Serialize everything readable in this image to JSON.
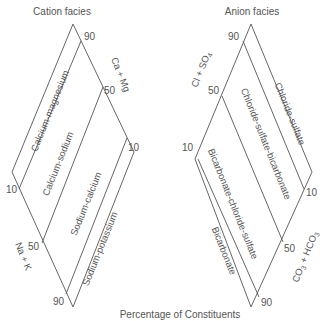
{
  "cation": {
    "title": "Cation facies",
    "axis_top": "Ca + Mg",
    "axis_bottom": "Na + K",
    "ticks": {
      "t90": "90",
      "t50_upper": "50",
      "t10_right": "10",
      "t10_left": "10",
      "t50_lower": "50",
      "t90_bottom": "90"
    },
    "facies": [
      "Calcium-magnesium",
      "Calcium-sodium",
      "Sodium-calcium",
      "Sodium-potassium"
    ]
  },
  "anion": {
    "title": "Anion facies",
    "axis_top": "Cl + SO4",
    "axis_bottom": "CO3 + HCO3",
    "ticks": {
      "t90": "90",
      "t50_upper": "50",
      "t10_left": "10",
      "t10_right": "10",
      "t50_lower": "50",
      "t90_bottom": "90"
    },
    "facies": [
      "Chloride-sulfate",
      "Chloride-sulfate-bicarbonate",
      "Bicarbonate-chloride-sulfate",
      "Bicarbonate"
    ]
  },
  "footer": {
    "caption": "Percentage of Constituents"
  },
  "colors": {
    "line": "#555555",
    "text": "#555555",
    "background": "#ffffff"
  }
}
